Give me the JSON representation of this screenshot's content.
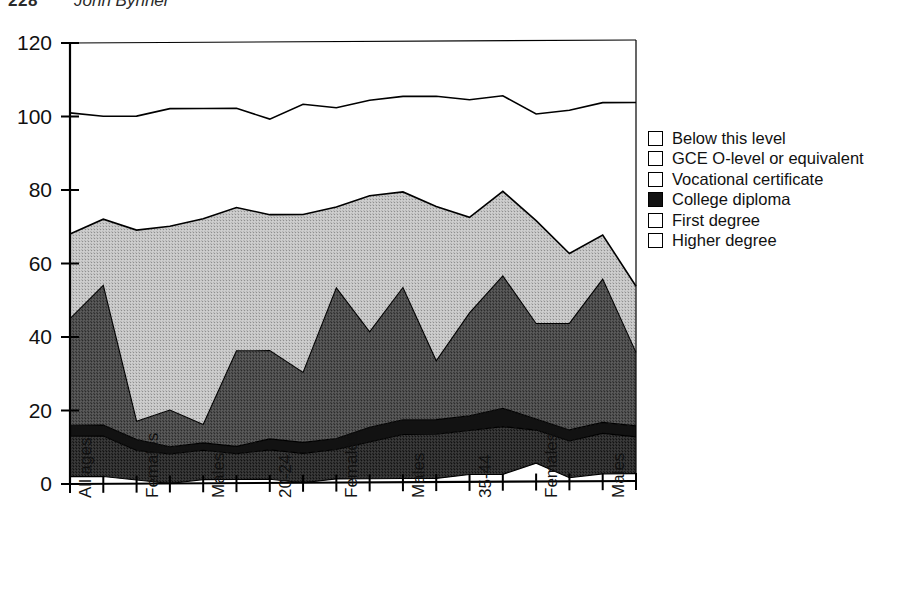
{
  "page_header": {
    "folio": "228",
    "running_title": "John Bynner"
  },
  "legend": {
    "items": [
      {
        "label": "Below this level",
        "swatch": "white",
        "color": "#ffffff"
      },
      {
        "label": "GCE O-level or equivalent",
        "swatch": "light-gray",
        "color": "#b9b9b9"
      },
      {
        "label": "Vocational certificate",
        "swatch": "medium-gray",
        "color": "#585858"
      },
      {
        "label": "College diploma",
        "swatch": "near-black",
        "color": "#121212"
      },
      {
        "label": "First degree",
        "swatch": "dark-gray",
        "color": "#3a3a3a"
      },
      {
        "label": "Higher degree",
        "swatch": "white",
        "color": "#ffffff"
      }
    ]
  },
  "chart_data": {
    "type": "area",
    "stacked": true,
    "title": "",
    "xlabel": "",
    "ylabel": "",
    "ylim": [
      0,
      120
    ],
    "yticks": [
      0,
      20,
      40,
      60,
      80,
      100,
      120
    ],
    "ytick_labels": [
      "0",
      "20",
      "40",
      "60",
      "80",
      "100",
      "120"
    ],
    "grid": false,
    "legend_position": "right",
    "x_count": 18,
    "xtick_labels": [
      "All ages",
      "",
      "Females",
      "",
      "Males",
      "",
      "20-24",
      "",
      "Females",
      "",
      "Males",
      "",
      "35-44",
      "",
      "Females",
      "",
      "Males",
      ""
    ],
    "xtick_label_positions": [
      0,
      2,
      4,
      6,
      8,
      10,
      12,
      14,
      16
    ],
    "xtick_labels_shown": [
      "All ages",
      "Females",
      "Males",
      "20-24",
      "Females",
      "Males",
      "35-44",
      "Females",
      "Males"
    ],
    "series": [
      {
        "name": "Higher degree",
        "color": "#ffffff",
        "values": [
          2,
          2,
          1,
          0,
          1,
          1,
          1,
          0,
          1,
          1,
          1,
          1,
          2,
          2,
          5,
          1,
          2,
          2
        ]
      },
      {
        "name": "First degree",
        "color": "#3a3a3a",
        "values": [
          11,
          11,
          8,
          8,
          8,
          7,
          8,
          8,
          8,
          10,
          12,
          12,
          12,
          13,
          9,
          10,
          11,
          10
        ]
      },
      {
        "name": "College diploma",
        "color": "#121212",
        "values": [
          3,
          3,
          3,
          2,
          2,
          2,
          3,
          3,
          3,
          4,
          4,
          4,
          4,
          5,
          3,
          3,
          3,
          3
        ]
      },
      {
        "name": "Vocational certificate",
        "color": "#585858",
        "values": [
          29,
          38,
          5,
          10,
          5,
          26,
          24,
          19,
          41,
          26,
          36,
          16,
          28,
          36,
          26,
          29,
          39,
          20
        ]
      },
      {
        "name": "GCE O-level or equivalent",
        "color": "#b9b9b9",
        "values": [
          23,
          18,
          52,
          50,
          56,
          39,
          37,
          43,
          22,
          37,
          26,
          42,
          26,
          23,
          28,
          19,
          12,
          18
        ]
      },
      {
        "name": "Below this level",
        "color": "#ffffff",
        "values": [
          33,
          28,
          31,
          32,
          30,
          27,
          26,
          30,
          27,
          26,
          26,
          30,
          32,
          26,
          29,
          39,
          36,
          50
        ]
      }
    ],
    "total_line": [
      101,
      100,
      100,
      102,
      102,
      102,
      99,
      103,
      102,
      104,
      105,
      105,
      104,
      105,
      100,
      101,
      103,
      103
    ]
  }
}
